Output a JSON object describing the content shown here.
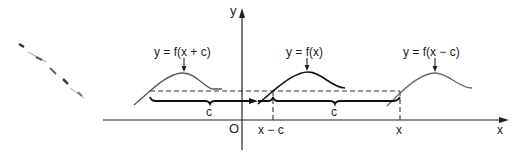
{
  "diagram": {
    "axes": {
      "y_label": "y",
      "x_label": "x",
      "origin_label": "O"
    },
    "x_ticks": {
      "x_minus_c": "x − c",
      "x": "x"
    },
    "curves": [
      {
        "label": "y = f(x + c)",
        "stroke": "#555555"
      },
      {
        "label": "y = f(x)",
        "stroke": "#111111"
      },
      {
        "label": "y = f(x − c)",
        "stroke": "#666666"
      }
    ],
    "braces": [
      {
        "label": "c"
      },
      {
        "label": "c"
      }
    ],
    "colors": {
      "axis": "#222222",
      "dashed": "#333333",
      "background": "#ffffff"
    }
  }
}
